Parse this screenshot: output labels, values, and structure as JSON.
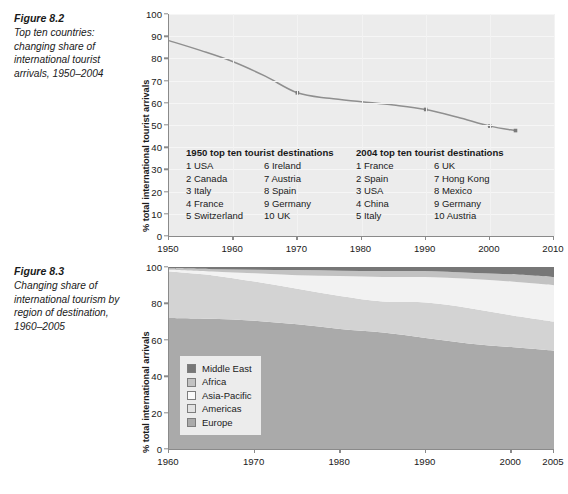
{
  "figure_82": {
    "caption": {
      "number": "Figure 8.2",
      "text": "Top ten countries: changing share of international tourist arrivals, 1950–2004"
    },
    "tables": {
      "table_1950": {
        "heading": "1950 top ten tourist destinations",
        "left": [
          "1 USA",
          "2 Canada",
          "3 Italy",
          "4 France",
          "5 Switzerland"
        ],
        "right": [
          "6 Ireland",
          "7 Austria",
          "8 Spain",
          "9 Germany",
          "10 UK"
        ]
      },
      "table_2004": {
        "heading": "2004 top ten tourist destinations",
        "left": [
          "1 France",
          "2 Spain",
          "3 USA",
          "4 China",
          "5 Italy"
        ],
        "right": [
          "6 UK",
          "7 Hong Kong",
          "8 Mexico",
          "9 Germany",
          "10 Austria"
        ]
      }
    },
    "chart_data": {
      "type": "line",
      "title": "Top ten countries: changing share of international tourist arrivals, 1950–2004",
      "xlabel": "",
      "ylabel": "% total international tourist arrivals",
      "xlim": [
        1950,
        2010
      ],
      "ylim": [
        0,
        100
      ],
      "xticks": [
        1950,
        1960,
        1970,
        1980,
        1990,
        2000,
        2010
      ],
      "yticks": [
        0,
        10,
        20,
        30,
        40,
        50,
        60,
        70,
        80,
        90,
        100
      ],
      "grid": true,
      "legend": "none",
      "line_color": "#8f8f8f",
      "marker_color": "#7a7a7a",
      "series": [
        {
          "name": "Top ten countries share",
          "x": [
            1950,
            1955,
            1960,
            1965,
            1970,
            1975,
            1980,
            1985,
            1990,
            1995,
            2000,
            2004
          ],
          "values": [
            88.0,
            83.5,
            78.5,
            72.0,
            64.5,
            62.0,
            60.5,
            59.0,
            57.0,
            53.5,
            49.5,
            47.5
          ],
          "markers_at": [
            1970,
            1990,
            2000,
            2004
          ]
        }
      ]
    }
  },
  "figure_83": {
    "caption": {
      "number": "Figure 8.3",
      "text": "Changing share of international tourism by region of destination, 1960–2005"
    },
    "chart_data": {
      "type": "area",
      "title": "Changing share of international tourism by region of destination, 1960–2005",
      "xlabel": "",
      "ylabel": "% total international arrivals",
      "xlim": [
        1960,
        2005
      ],
      "ylim": [
        0,
        100
      ],
      "xticks": [
        1960,
        1970,
        1980,
        1990,
        2000,
        2005
      ],
      "yticks": [
        0,
        20,
        40,
        60,
        80,
        100
      ],
      "stacked": true,
      "grid": false,
      "legend_position": "inside-left",
      "x": [
        1960,
        1965,
        1970,
        1975,
        1980,
        1985,
        1990,
        1995,
        2000,
        2005
      ],
      "series": [
        {
          "name": "Europe",
          "color": "#aaaaaa",
          "values": [
            72.0,
            71.5,
            70.5,
            68.5,
            66.0,
            64.0,
            61.0,
            58.0,
            56.0,
            54.0
          ]
        },
        {
          "name": "Americas",
          "color": "#d3d3d3",
          "values": [
            25.5,
            24.0,
            21.5,
            19.5,
            18.0,
            17.0,
            19.5,
            19.5,
            17.5,
            16.0
          ]
        },
        {
          "name": "Asia-Pacific",
          "color": "#f2f2f2",
          "values": [
            1.0,
            2.0,
            4.5,
            7.5,
            11.0,
            13.5,
            14.0,
            16.0,
            18.5,
            20.0
          ]
        },
        {
          "name": "Africa",
          "color": "#c2c2c2",
          "values": [
            0.8,
            1.3,
            2.0,
            2.8,
            3.0,
            3.3,
            3.3,
            3.3,
            4.0,
            4.5
          ]
        },
        {
          "name": "Middle East",
          "color": "#777777",
          "values": [
            0.7,
            1.2,
            1.5,
            1.7,
            2.0,
            2.2,
            2.2,
            3.2,
            4.0,
            5.5
          ]
        }
      ],
      "legend_entries": [
        {
          "label": "Middle East",
          "color": "#777777"
        },
        {
          "label": "Africa",
          "color": "#c2c2c2"
        },
        {
          "label": "Asia-Pacific",
          "color": "#fbfbfb"
        },
        {
          "label": "Americas",
          "color": "#e2e2e2"
        },
        {
          "label": "Europe",
          "color": "#aaaaaa"
        }
      ]
    }
  }
}
